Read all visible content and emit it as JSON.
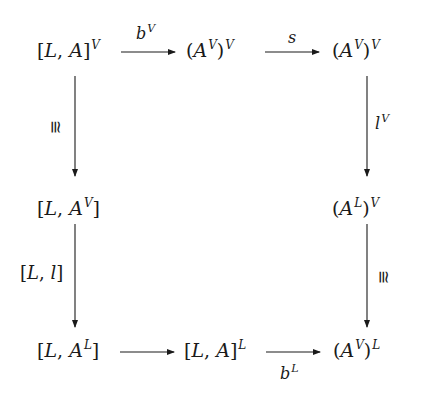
{
  "diagram": {
    "type": "commutative-diagram",
    "nodes": {
      "top_left": {
        "open": "[",
        "a": "L",
        "sep": ", ",
        "b": "A",
        "close": "]",
        "sup": "V",
        "text": "[L, A]^V"
      },
      "top_mid": {
        "open": "(",
        "a": "A",
        "a_sup": "V",
        "close": ")",
        "sup": "V",
        "text": "(A^V)^V"
      },
      "top_right": {
        "open": "(",
        "a": "A",
        "a_sup": "V",
        "close": ")",
        "sup": "V",
        "text": "(A^V)^V"
      },
      "mid_left": {
        "open": "[",
        "a": "L",
        "sep": ", ",
        "b": "A",
        "b_sup": "V",
        "close": "]",
        "text": "[L, A^V]"
      },
      "mid_right": {
        "open": "(",
        "a": "A",
        "a_sup": "L",
        "close": ")",
        "sup": "V",
        "text": "(A^L)^V"
      },
      "bottom_left": {
        "open": "[",
        "a": "L",
        "sep": ", ",
        "b": "A",
        "b_sup": "L",
        "close": "]",
        "text": "[L, A^L]"
      },
      "bottom_mid": {
        "open": "[",
        "a": "L",
        "sep": ", ",
        "b": "A",
        "close": "]",
        "sup": "L",
        "text": "[L, A]^L"
      },
      "bottom_right": {
        "open": "(",
        "a": "A",
        "a_sup": "V",
        "close": ")",
        "sup": "L",
        "text": "(A^V)^L"
      }
    },
    "arrows": [
      {
        "from": "top_left",
        "to": "top_mid",
        "label": "b",
        "label_sup": "V",
        "label_pos": "above"
      },
      {
        "from": "top_mid",
        "to": "top_right",
        "label": "s",
        "label_pos": "above"
      },
      {
        "from": "top_left",
        "to": "mid_left",
        "label": "≅",
        "label_pos": "left"
      },
      {
        "from": "top_right",
        "to": "mid_right",
        "label": "l",
        "label_sup": "V",
        "label_pos": "right"
      },
      {
        "from": "mid_left",
        "to": "bottom_left",
        "label": "[L, l]",
        "label_pos": "left"
      },
      {
        "from": "mid_right",
        "to": "bottom_right",
        "label": "≅",
        "label_pos": "right"
      },
      {
        "from": "bottom_left",
        "to": "bottom_mid",
        "label": "",
        "label_pos": "none"
      },
      {
        "from": "bottom_mid",
        "to": "bottom_right",
        "label": "b",
        "label_sup": "L",
        "label_pos": "below"
      }
    ],
    "labels": {
      "iso": "≅",
      "b": "b",
      "s": "s",
      "l": "l",
      "L": "L",
      "V": "V",
      "lbracket_l": "[L, l]"
    },
    "colors": {
      "ink": "#1a1a1a",
      "background": "#ffffff"
    }
  }
}
